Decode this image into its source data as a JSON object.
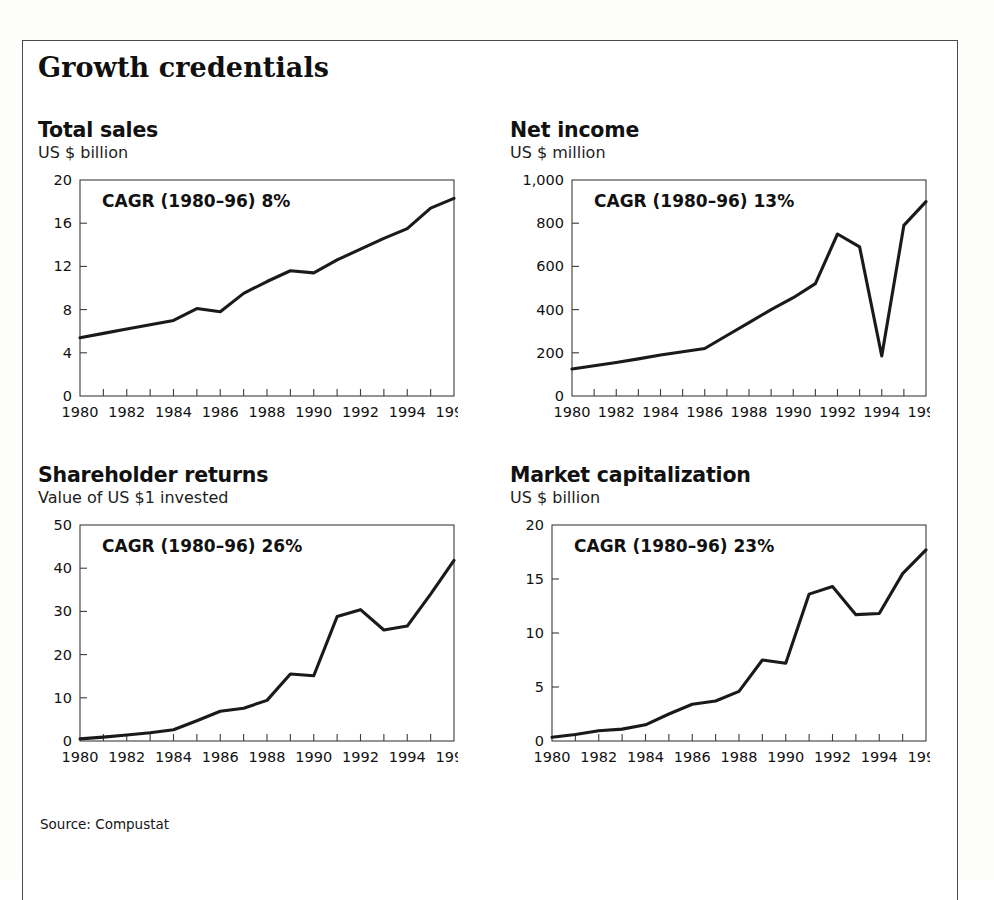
{
  "figure": {
    "title": "Growth credentials",
    "source": "Source: Compustat"
  },
  "chart_data": [
    {
      "type": "line",
      "title": "Total sales",
      "subtitle": "US $ billion",
      "annotation": "CAGR (1980–96) 8%",
      "xlabel": "",
      "ylabel": "US $ billion",
      "xlim": [
        1980,
        1996
      ],
      "ylim": [
        0,
        20
      ],
      "yticks": [
        0,
        4,
        8,
        12,
        16,
        20
      ],
      "ytick_labels": [
        "0",
        "4",
        "8",
        "12",
        "16",
        "20"
      ],
      "xticks": [
        1980,
        1981,
        1982,
        1983,
        1984,
        1985,
        1986,
        1987,
        1988,
        1989,
        1990,
        1991,
        1992,
        1993,
        1994,
        1995,
        1996
      ],
      "xtick_labels": [
        "1980",
        "",
        "1982",
        "",
        "1984",
        "",
        "1986",
        "",
        "1988",
        "",
        "1990",
        "",
        "1992",
        "",
        "1994",
        "",
        "1996"
      ],
      "grid": false,
      "legend": "none",
      "x": [
        1980,
        1981,
        1982,
        1983,
        1984,
        1985,
        1986,
        1987,
        1988,
        1989,
        1990,
        1991,
        1992,
        1993,
        1994,
        1995,
        1996
      ],
      "values": [
        5.4,
        5.8,
        6.2,
        6.6,
        7.0,
        8.1,
        7.8,
        9.5,
        10.6,
        11.6,
        11.4,
        12.6,
        13.6,
        14.6,
        15.5,
        17.4,
        18.3
      ]
    },
    {
      "type": "line",
      "title": "Net income",
      "subtitle": "US $ million",
      "annotation": "CAGR (1980–96) 13%",
      "xlabel": "",
      "ylabel": "US $ million",
      "xlim": [
        1980,
        1996
      ],
      "ylim": [
        0,
        1000
      ],
      "yticks": [
        0,
        200,
        400,
        600,
        800,
        1000
      ],
      "ytick_labels": [
        "0",
        "200",
        "400",
        "600",
        "800",
        "1,000"
      ],
      "xticks": [
        1980,
        1981,
        1982,
        1983,
        1984,
        1985,
        1986,
        1987,
        1988,
        1989,
        1990,
        1991,
        1992,
        1993,
        1994,
        1995,
        1996
      ],
      "xtick_labels": [
        "1980",
        "",
        "1982",
        "",
        "1984",
        "",
        "1986",
        "",
        "1988",
        "",
        "1990",
        "",
        "1992",
        "",
        "1994",
        "",
        "1996"
      ],
      "grid": false,
      "legend": "none",
      "x": [
        1980,
        1981,
        1982,
        1983,
        1984,
        1985,
        1986,
        1987,
        1988,
        1989,
        1990,
        1991,
        1992,
        1993,
        1994,
        1995,
        1996
      ],
      "values": [
        125,
        140,
        155,
        172,
        190,
        205,
        220,
        280,
        340,
        400,
        455,
        520,
        750,
        690,
        185,
        790,
        900
      ]
    },
    {
      "type": "line",
      "title": "Shareholder returns",
      "subtitle": "Value of US $1 invested",
      "annotation": "CAGR (1980–96) 26%",
      "xlabel": "",
      "ylabel": "Value of US $1 invested",
      "xlim": [
        1980,
        1996
      ],
      "ylim": [
        0,
        50
      ],
      "yticks": [
        0,
        10,
        20,
        30,
        40,
        50
      ],
      "ytick_labels": [
        "0",
        "10",
        "20",
        "30",
        "40",
        "50"
      ],
      "xticks": [
        1980,
        1981,
        1982,
        1983,
        1984,
        1985,
        1986,
        1987,
        1988,
        1989,
        1990,
        1991,
        1992,
        1993,
        1994,
        1995,
        1996
      ],
      "xtick_labels": [
        "1980",
        "",
        "1982",
        "",
        "1984",
        "",
        "1986",
        "",
        "1988",
        "",
        "1990",
        "",
        "1992",
        "",
        "1994",
        "",
        "1996"
      ],
      "grid": false,
      "legend": "none",
      "x": [
        1980,
        1981,
        1982,
        1983,
        1984,
        1985,
        1986,
        1987,
        1988,
        1989,
        1990,
        1991,
        1992,
        1993,
        1994,
        1995,
        1996
      ],
      "values": [
        0.5,
        0.9,
        1.4,
        1.9,
        2.6,
        4.7,
        6.9,
        7.6,
        9.4,
        15.5,
        15.1,
        28.8,
        30.4,
        25.7,
        26.6,
        34.0,
        41.8
      ]
    },
    {
      "type": "line",
      "title": "Market capitalization",
      "subtitle": "US $ billion",
      "annotation": "CAGR (1980–96) 23%",
      "xlabel": "",
      "ylabel": "US $ billion",
      "xlim": [
        1980,
        1996
      ],
      "ylim": [
        0,
        20
      ],
      "yticks": [
        0,
        5,
        10,
        15,
        20
      ],
      "ytick_labels": [
        "0",
        "5",
        "10",
        "15",
        "20"
      ],
      "xticks": [
        1980,
        1981,
        1982,
        1983,
        1984,
        1985,
        1986,
        1987,
        1988,
        1989,
        1990,
        1991,
        1992,
        1993,
        1994,
        1995,
        1996
      ],
      "xtick_labels": [
        "1980",
        "",
        "1982",
        "",
        "1984",
        "",
        "1986",
        "",
        "1988",
        "",
        "1990",
        "",
        "1992",
        "",
        "1994",
        "",
        "1996"
      ],
      "grid": false,
      "legend": "none",
      "x": [
        1980,
        1981,
        1982,
        1983,
        1984,
        1985,
        1986,
        1987,
        1988,
        1989,
        1990,
        1991,
        1992,
        1993,
        1994,
        1995,
        1996
      ],
      "values": [
        0.35,
        0.6,
        0.95,
        1.1,
        1.5,
        2.5,
        3.4,
        3.7,
        4.6,
        7.5,
        7.2,
        13.6,
        14.3,
        11.7,
        11.8,
        15.5,
        17.7
      ]
    }
  ],
  "style": {
    "line_color": "#1a1a1a",
    "axis_color": "#3c3c3c",
    "text_color": "#111111"
  }
}
